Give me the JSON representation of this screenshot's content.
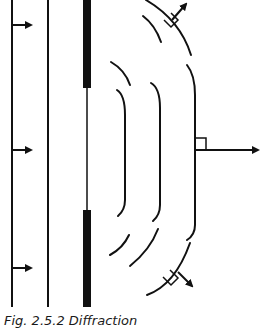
{
  "figure": {
    "caption": "Fig. 2.5.2 Diffraction",
    "colors": {
      "ink": "#111111",
      "background": "#ffffff"
    }
  },
  "elements": {
    "incident_wavefronts": 2,
    "incident_arrows": 3,
    "barrier": "wall with gap",
    "diffracted_wavefronts": 3,
    "propagation_arrows": 3
  }
}
